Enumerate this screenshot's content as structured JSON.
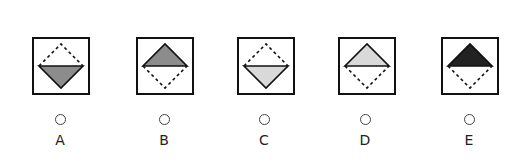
{
  "question": {
    "type": "multiple-choice-figure",
    "options": [
      {
        "label": "A",
        "filled_half": "bottom",
        "fill_color": "#8c8c8c",
        "box_left": 32,
        "center_x": 60,
        "icon": "diamond-bottom-half-medium-gray-icon"
      },
      {
        "label": "B",
        "filled_half": "top",
        "fill_color": "#8c8c8c",
        "box_left": 136,
        "center_x": 164,
        "icon": "diamond-top-half-medium-gray-icon"
      },
      {
        "label": "C",
        "filled_half": "bottom",
        "fill_color": "#d9d9d9",
        "box_left": 237,
        "center_x": 264,
        "icon": "diamond-bottom-half-light-gray-icon"
      },
      {
        "label": "D",
        "filled_half": "top",
        "fill_color": "#d9d9d9",
        "box_left": 338,
        "center_x": 365,
        "icon": "diamond-top-half-light-gray-icon"
      },
      {
        "label": "E",
        "filled_half": "top",
        "fill_color": "#222222",
        "box_left": 441,
        "center_x": 469,
        "icon": "diamond-top-half-black-icon"
      }
    ],
    "selected": null
  },
  "colors": {
    "stroke": "#111111",
    "box_border": "#111111",
    "radio_border": "#444444",
    "label_text": "#222222",
    "background": "#ffffff"
  }
}
